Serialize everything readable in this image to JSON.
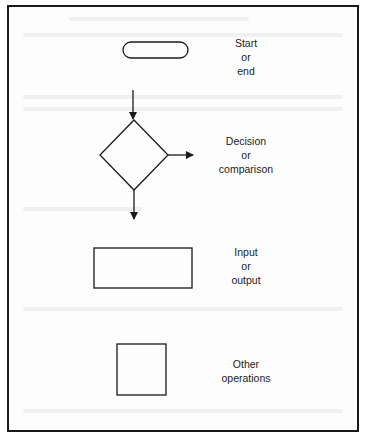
{
  "diagram": {
    "type": "flowchart-symbol-legend",
    "colors": {
      "stroke": "#1a1a1a",
      "background": "#ffffff",
      "text": "#1c1c1c"
    },
    "symbols": [
      {
        "id": "terminal",
        "shape": "rounded-rectangle",
        "label": [
          "Start",
          "or",
          "end"
        ]
      },
      {
        "id": "decision",
        "shape": "diamond",
        "label": [
          "Decision",
          "or",
          "comparison"
        ],
        "arrows": [
          "in-top",
          "out-right",
          "out-bottom"
        ]
      },
      {
        "id": "io",
        "shape": "rectangle",
        "label": [
          "Input",
          "or",
          "output"
        ]
      },
      {
        "id": "process",
        "shape": "square",
        "label": [
          "Other",
          "operations"
        ]
      }
    ]
  }
}
